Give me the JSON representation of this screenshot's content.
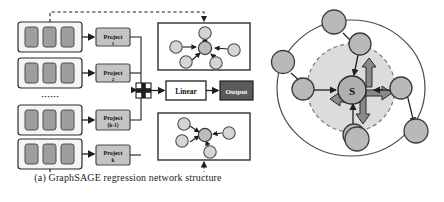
{
  "figure": {
    "panels": [
      {
        "id": "a",
        "caption": "(a) GraphSAGE regression network structure",
        "feature_blocks": [
          {
            "label": "",
            "bars": 3
          },
          {
            "label": "",
            "bars": 3
          },
          {
            "label": "",
            "bars": 3
          },
          {
            "label": "",
            "bars": 3
          }
        ],
        "ellipsis": "······",
        "project_blocks": [
          {
            "line1": "Project",
            "line2": "1"
          },
          {
            "line1": "Project",
            "line2": "2"
          },
          {
            "line1": "Project",
            "line2": "(k-1)"
          },
          {
            "line1": "Project",
            "line2": "k"
          }
        ],
        "concat_symbol": "+",
        "linear_label": "Linear",
        "output_label": "Output",
        "graph_panels": [
          {
            "name": "aggregation-graph-top",
            "center_nodes": 1,
            "neighbor_nodes": 5
          },
          {
            "name": "aggregation-graph-bottom",
            "center_nodes": 1,
            "neighbor_nodes": 4
          }
        ]
      },
      {
        "id": "b",
        "caption": "(b) Node aggregation",
        "center_node_label": "S",
        "inner_neighbor_count": 4,
        "outer_neighbor_count": 4
      }
    ],
    "colors": {
      "node_fill": "#c9c9c9",
      "node_stroke": "#4d4d4d",
      "box_fill_light": "#f2f2f2",
      "box_fill_gray": "#c4c4c4",
      "box_fill_dark": "#5a5a5a",
      "bar_fill": "#9e9e9e",
      "inner_disc": "#d8d8d8",
      "stroke": "#2b2b2b",
      "arrow": "#7a7a7a"
    }
  }
}
